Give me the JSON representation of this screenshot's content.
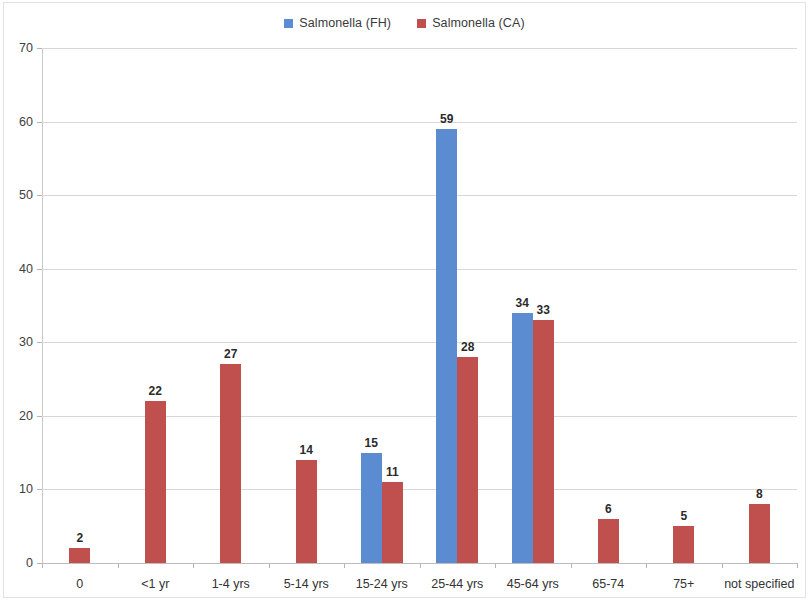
{
  "legend": {
    "position": "top-center",
    "entries": [
      {
        "label": "Salmonella (FH)",
        "color": "#5b8bd0"
      },
      {
        "label": "Salmonella (CA)",
        "color": "#c0504d"
      }
    ]
  },
  "chart_data": {
    "type": "bar",
    "title": "",
    "subtitle": "",
    "xlabel": "",
    "ylabel": "",
    "ylim": [
      0,
      70
    ],
    "yticks": [
      0,
      10,
      20,
      30,
      40,
      50,
      60,
      70
    ],
    "grid": true,
    "categories": [
      "0",
      "<1 yr",
      "1-4 yrs",
      "5-14 yrs",
      "15-24 yrs",
      "25-44 yrs",
      "45-64 yrs",
      "65-74",
      "75+",
      "not specified"
    ],
    "series": [
      {
        "name": "Salmonella (FH)",
        "color": "#5b8bd0",
        "values": [
          null,
          null,
          null,
          null,
          15,
          59,
          34,
          null,
          null,
          null
        ]
      },
      {
        "name": "Salmonella (CA)",
        "color": "#c0504d",
        "values": [
          2,
          22,
          27,
          14,
          11,
          28,
          33,
          6,
          5,
          8
        ]
      }
    ],
    "data_labels": true
  }
}
